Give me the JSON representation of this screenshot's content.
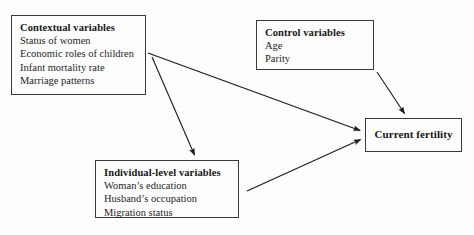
{
  "diagram": {
    "background_color": "#fdfdfd",
    "line_color": "#1a1a1a",
    "text_color": "#161616",
    "nodes": {
      "contextual": {
        "title": "Contextual variables",
        "items": [
          "Status of women",
          "Economic roles of children",
          "Infant mortality rate",
          "Marriage patterns"
        ]
      },
      "control": {
        "title": "Control variables",
        "items": [
          "Age",
          "Parity"
        ]
      },
      "individual": {
        "title": "Individual-level variables",
        "items": [
          "Woman’s education",
          "Husband’s occupation",
          "Migration status"
        ]
      },
      "fertility": {
        "title": "Current fertility"
      }
    },
    "arrows": [
      {
        "name": "contextual-to-fertility",
        "from": "contextual",
        "to": "fertility",
        "x1": 148,
        "y1": 53,
        "x2": 362,
        "y2": 131
      },
      {
        "name": "contextual-to-individual",
        "from": "contextual",
        "to": "individual",
        "x1": 152,
        "y1": 57,
        "x2": 195,
        "y2": 157
      },
      {
        "name": "control-to-fertility",
        "from": "control",
        "to": "fertility",
        "x1": 377,
        "y1": 72,
        "x2": 405,
        "y2": 115
      },
      {
        "name": "individual-to-fertility",
        "from": "individual",
        "to": "fertility",
        "x1": 247,
        "y1": 191,
        "x2": 362,
        "y2": 139
      }
    ]
  }
}
